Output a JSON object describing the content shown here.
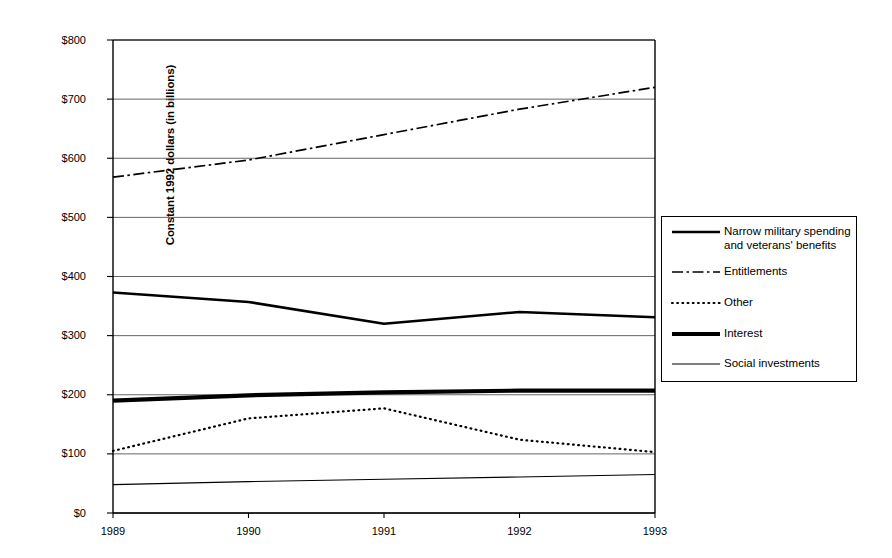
{
  "chart_data": {
    "type": "line",
    "title": "",
    "xlabel": "",
    "ylabel": "Constant 1992 dollars (in billions)",
    "x": [
      1989,
      1990,
      1991,
      1992,
      1993
    ],
    "xtick_labels": [
      "1989",
      "1990",
      "1991",
      "1992",
      "1993"
    ],
    "ytick_labels": [
      "$800",
      "$700",
      "$600",
      "$500",
      "$400",
      "$300",
      "$200",
      "$100",
      "$0"
    ],
    "ytick_values": [
      800,
      700,
      600,
      500,
      400,
      300,
      200,
      100,
      0
    ],
    "ylim": [
      0,
      800
    ],
    "xlim": [
      1989,
      1993
    ],
    "grid": "horizontal",
    "legend_position": "right-outside",
    "series": [
      {
        "name": "Narrow military spending and veterans' benefits",
        "style": "solid-medium",
        "values": [
          373,
          357,
          320,
          340,
          331
        ]
      },
      {
        "name": "Entitlements",
        "style": "dash-dot",
        "values": [
          568,
          597,
          640,
          683,
          720
        ]
      },
      {
        "name": "Other",
        "style": "dotted",
        "values": [
          105,
          160,
          177,
          124,
          103
        ]
      },
      {
        "name": "Interest",
        "style": "solid-thick",
        "values": [
          190,
          199,
          204,
          207,
          207
        ]
      },
      {
        "name": "Social investments",
        "style": "solid-thin",
        "values": [
          48,
          53,
          57,
          61,
          65
        ]
      }
    ]
  },
  "legend": {
    "entries": [
      {
        "label": "Narrow military spending\nand veterans' benefits",
        "style": "solid-medium"
      },
      {
        "label": "Entitlements",
        "style": "dash-dot"
      },
      {
        "label": "Other",
        "style": "dotted"
      },
      {
        "label": "Interest",
        "style": "solid-thick"
      },
      {
        "label": "Social investments",
        "style": "solid-thin"
      }
    ]
  },
  "colors": {
    "line": "#000000",
    "grid": "#555555",
    "axis": "#000000",
    "background": "#ffffff"
  }
}
